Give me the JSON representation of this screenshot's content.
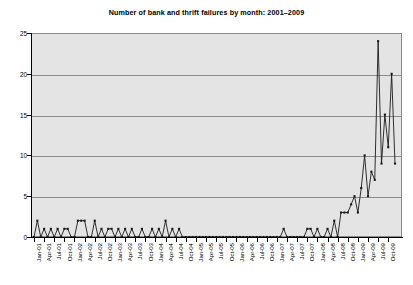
{
  "chart_data": {
    "type": "line",
    "title": "Number of bank and thrift failures by month: 2001–2009",
    "xlabel": "",
    "ylabel": "",
    "ylim": [
      0,
      25
    ],
    "yticks": [
      0,
      5,
      10,
      15,
      20,
      25
    ],
    "grid": true,
    "legend": "none",
    "marker": "filled-square",
    "line_color": "#1a1a1a",
    "plot_background": "#e4e4e4",
    "gridline_color": "#8c8c8c",
    "x_tick_label_rotation": -90,
    "x_tick_label_interval_months": 3,
    "categories": [
      "Jan-01",
      "Feb-01",
      "Mar-01",
      "Apr-01",
      "May-01",
      "Jun-01",
      "Jul-01",
      "Aug-01",
      "Sep-01",
      "Oct-01",
      "Nov-01",
      "Dec-01",
      "Jan-02",
      "Feb-02",
      "Mar-02",
      "Apr-02",
      "May-02",
      "Jun-02",
      "Jul-02",
      "Aug-02",
      "Sep-02",
      "Oct-02",
      "Nov-02",
      "Dec-02",
      "Jan-03",
      "Feb-03",
      "Mar-03",
      "Apr-03",
      "May-03",
      "Jun-03",
      "Jul-03",
      "Aug-03",
      "Sep-03",
      "Oct-03",
      "Nov-03",
      "Dec-03",
      "Jan-04",
      "Feb-04",
      "Mar-04",
      "Apr-04",
      "May-04",
      "Jun-04",
      "Jul-04",
      "Aug-04",
      "Sep-04",
      "Oct-04",
      "Nov-04",
      "Dec-04",
      "Jan-05",
      "Feb-05",
      "Mar-05",
      "Apr-05",
      "May-05",
      "Jun-05",
      "Jul-05",
      "Aug-05",
      "Sep-05",
      "Oct-05",
      "Nov-05",
      "Dec-05",
      "Jan-06",
      "Feb-06",
      "Mar-06",
      "Apr-06",
      "May-06",
      "Jun-06",
      "Jul-06",
      "Aug-06",
      "Sep-06",
      "Oct-06",
      "Nov-06",
      "Dec-06",
      "Jan-07",
      "Feb-07",
      "Mar-07",
      "Apr-07",
      "May-07",
      "Jun-07",
      "Jul-07",
      "Aug-07",
      "Sep-07",
      "Oct-07",
      "Nov-07",
      "Dec-07",
      "Jan-08",
      "Feb-08",
      "Mar-08",
      "Apr-08",
      "May-08",
      "Jun-08",
      "Jul-08",
      "Aug-08",
      "Sep-08",
      "Oct-08",
      "Nov-08",
      "Dec-08",
      "Jan-09",
      "Feb-09",
      "Mar-09",
      "Apr-09",
      "May-09",
      "Jun-09",
      "Jul-09",
      "Aug-09",
      "Sep-09",
      "Oct-09",
      "Nov-09",
      "Dec-09"
    ],
    "tick_labels": [
      "Jan-01",
      "Apr-01",
      "Jul-01",
      "Oct-01",
      "Jan-02",
      "Apr-02",
      "Jul-02",
      "Oct-02",
      "Jan-03",
      "Apr-03",
      "Jul-03",
      "Oct-03",
      "Jan-04",
      "Apr-04",
      "Jul-04",
      "Oct-04",
      "Jan-05",
      "Apr-05",
      "Jul-05",
      "Oct-05",
      "Jan-06",
      "Apr-06",
      "Jul-06",
      "Oct-06",
      "Jan-07",
      "Apr-07",
      "Jul-07",
      "Oct-07",
      "Jan-08",
      "Apr-08",
      "Jul-08",
      "Oct-08",
      "Jan-09",
      "Apr-09",
      "Jul-09",
      "Oct-09"
    ],
    "values": [
      0,
      2,
      0,
      1,
      0,
      1,
      0,
      1,
      0,
      1,
      1,
      0,
      0,
      2,
      2,
      2,
      0,
      0,
      2,
      0,
      1,
      0,
      1,
      1,
      0,
      1,
      0,
      1,
      0,
      1,
      0,
      0,
      1,
      0,
      0,
      1,
      0,
      1,
      0,
      2,
      0,
      1,
      0,
      1,
      0,
      0,
      0,
      0,
      0,
      0,
      0,
      0,
      0,
      0,
      0,
      0,
      0,
      0,
      0,
      0,
      0,
      0,
      0,
      0,
      0,
      0,
      0,
      0,
      0,
      0,
      0,
      0,
      0,
      0,
      1,
      0,
      0,
      0,
      0,
      0,
      0,
      1,
      1,
      0,
      1,
      0,
      0,
      1,
      0,
      2,
      0,
      3,
      3,
      3,
      4,
      5,
      3,
      6,
      10,
      5,
      8,
      7,
      24,
      9,
      15,
      11,
      20,
      9
    ]
  }
}
